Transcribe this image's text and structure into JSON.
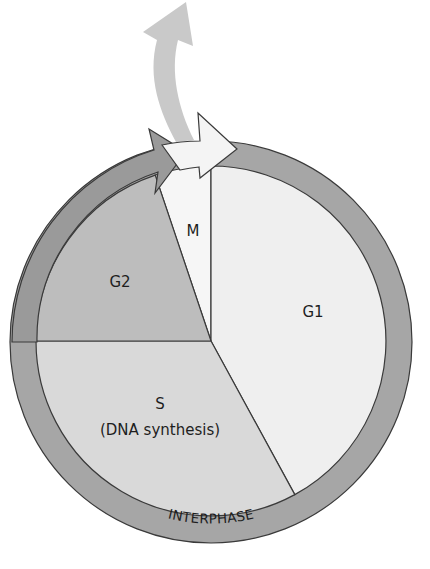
{
  "diagram": {
    "ring_label": "INTERPHASE",
    "phases": [
      {
        "id": "M",
        "label": "M",
        "sublabel": "",
        "color": "#f6f6f6"
      },
      {
        "id": "G1",
        "label": "G1",
        "sublabel": "",
        "color": "#efefef"
      },
      {
        "id": "S",
        "label": "S",
        "sublabel": "(DNA synthesis)",
        "color": "#d9d9d9"
      },
      {
        "id": "G2",
        "label": "G2",
        "sublabel": "",
        "color": "#bdbdbd"
      }
    ],
    "colors": {
      "ring": "#a6a6a6",
      "outline": "#3a3a3a",
      "mitosis_arrow": "#f4f4f4",
      "interphase_arrow": "#9a9a9a",
      "exit_arrow": "#c9c9c9",
      "background": "#ffffff"
    },
    "arrows": [
      {
        "id": "interphase-arrow",
        "meaning": "progression through interphase"
      },
      {
        "id": "mitosis-arrow",
        "meaning": "progression through mitosis"
      },
      {
        "id": "exit-arrow",
        "meaning": "exit from cell cycle"
      }
    ]
  }
}
